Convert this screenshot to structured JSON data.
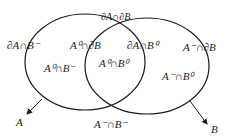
{
  "diagram": {
    "type": "venn",
    "sets": [
      {
        "name": "A",
        "label": "A"
      },
      {
        "name": "B",
        "label": "B"
      }
    ],
    "regions": [
      {
        "id": "boundaryA-extB",
        "label": "∂A∩B⁻"
      },
      {
        "id": "intA-boundaryB",
        "label": "A⁰∩∂B"
      },
      {
        "id": "boundaryA-boundaryB",
        "label": "∂A∩∂B"
      },
      {
        "id": "boundaryA-intB",
        "label": "∂A∩B⁰"
      },
      {
        "id": "extA-boundaryB",
        "label": "A⁻∩∂B"
      },
      {
        "id": "intA-extB",
        "label": "A⁰∩B⁻"
      },
      {
        "id": "intA-intB",
        "label": "A⁰∩B⁰"
      },
      {
        "id": "extA-intB",
        "label": "A⁻∩B⁰"
      },
      {
        "id": "extA-extB",
        "label": "A⁻∩B⁻"
      }
    ],
    "colors": {
      "stroke": "#1a1a1a",
      "background": "#ffffff"
    }
  }
}
